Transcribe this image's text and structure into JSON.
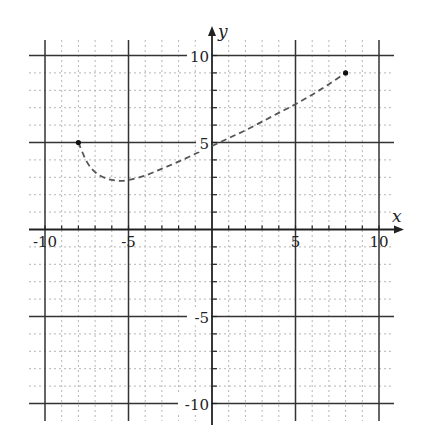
{
  "chart_data": {
    "type": "line",
    "title": "",
    "xlabel": "x",
    "ylabel": "y",
    "xlim": [
      -10,
      10
    ],
    "ylim": [
      -10,
      10
    ],
    "grid": true,
    "major_ticks": [
      -10,
      -5,
      5,
      10
    ],
    "x_tick_labels": [
      "-10",
      "-5",
      "5",
      "10"
    ],
    "y_tick_labels": [
      "10",
      "5",
      "-5",
      "-10"
    ],
    "series": [
      {
        "name": "curve",
        "style": "dashed",
        "endpoints": "closed dots",
        "x": [
          -8,
          -7.5,
          -7,
          -6.5,
          -6,
          -5.5,
          -5,
          -4,
          -3,
          -2,
          -1,
          0,
          1,
          2,
          3,
          4,
          5,
          6,
          7,
          8
        ],
        "y": [
          5,
          3.9,
          3.3,
          3.0,
          2.85,
          2.8,
          2.85,
          3.1,
          3.5,
          3.9,
          4.35,
          4.8,
          5.25,
          5.7,
          6.2,
          6.7,
          7.2,
          7.75,
          8.35,
          9
        ]
      }
    ]
  },
  "colors": {
    "major_grid": "#333333",
    "minor_grid": "#b5b5b5",
    "curve": "#555555"
  }
}
